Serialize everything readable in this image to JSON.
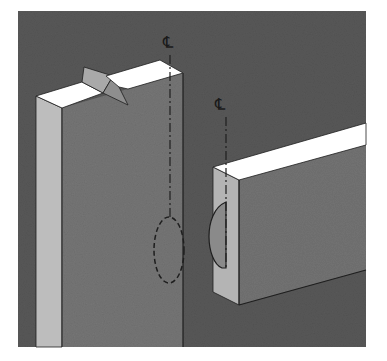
{
  "diagram": {
    "background_color": "#5a5a5a",
    "panel": {
      "x": 18,
      "y": 11,
      "width": 348,
      "height": 336
    },
    "colors": {
      "face_front": "#777777",
      "face_side_light": "#bdbdbd",
      "face_top": "#ffffff",
      "notch_face": "#a9a9a9",
      "rail_front": "#747474",
      "rail_end": "#b4b4b4",
      "biscuit_fill": "#8a8a8a",
      "line": "#1e1e1e"
    },
    "labels": {
      "post_centerline": "℄",
      "rail_centerline": "℄"
    },
    "parts": [
      {
        "name": "post",
        "description": "Vertical stile with V-notch mark on top"
      },
      {
        "name": "rail",
        "description": "Horizontal rail with biscuit slot on end grain"
      },
      {
        "name": "biscuit-slot-post",
        "description": "Dashed oval showing hidden slot location"
      },
      {
        "name": "biscuit-slot-rail",
        "description": "Half-oval biscuit visible on rail end"
      }
    ]
  }
}
